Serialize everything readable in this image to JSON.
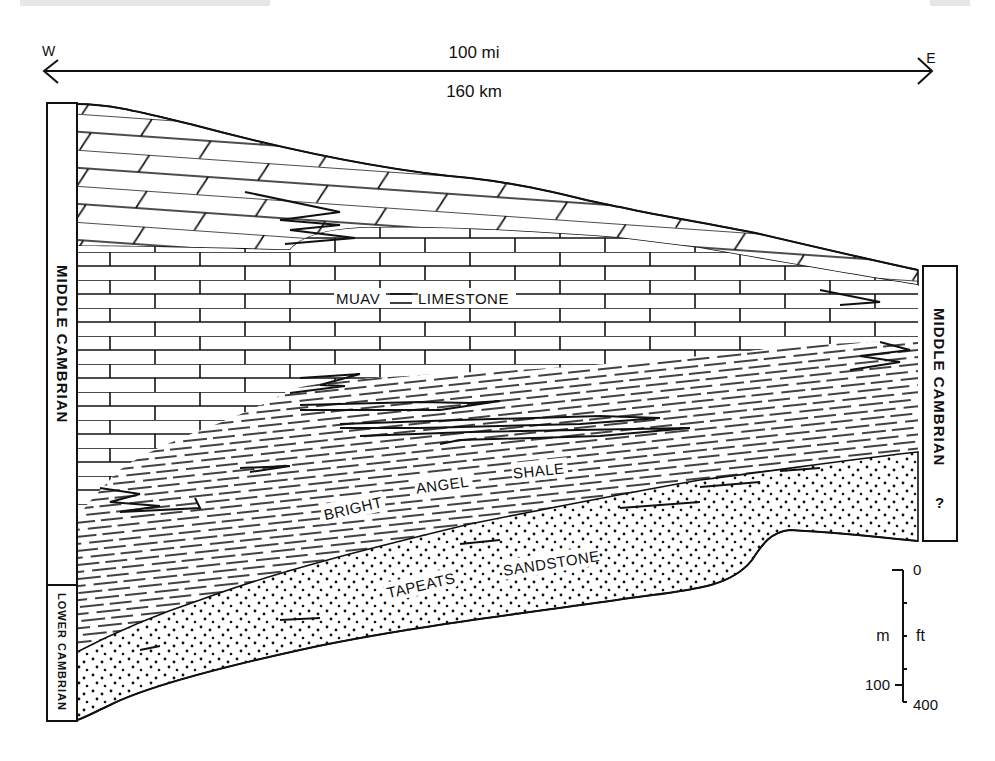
{
  "scale_bar": {
    "west_label": "W",
    "east_label": "E",
    "distance_mi": "100 mi",
    "distance_km": "160 km"
  },
  "columns": {
    "left_upper": "MIDDLE CAMBRIAN",
    "left_lower": "LOWER CAMBRIAN",
    "right_upper": "MIDDLE CAMBRIAN",
    "right_query": "?"
  },
  "units": {
    "muav": [
      "MUAV",
      "LIMESTONE"
    ],
    "bright_angel": [
      "BRIGHT",
      "ANGEL",
      "SHALE"
    ],
    "tapeats": [
      "TAPEATS",
      "SANDSTONE"
    ]
  },
  "vertical_scale": {
    "top_value": "0",
    "bottom_m": "100",
    "bottom_ft": "400",
    "metric_unit": "m",
    "imperial_unit": "ft"
  },
  "colors": {
    "ink": "#111111",
    "paper": "#ffffff"
  }
}
